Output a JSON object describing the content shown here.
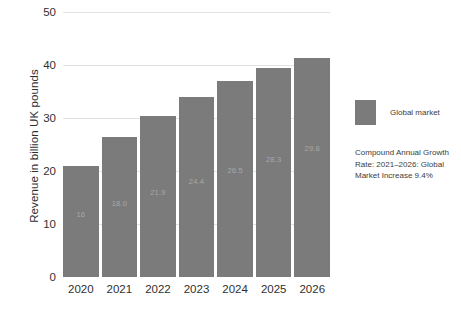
{
  "chart_data": {
    "type": "bar",
    "title": "",
    "subtitle": "",
    "xlabel": "",
    "ylabel": "Revenue in billion UK pounds",
    "categories": [
      "2020",
      "2021",
      "2022",
      "2023",
      "2024",
      "2025",
      "2026"
    ],
    "values": [
      21.0,
      26.5,
      30.4,
      33.9,
      36.9,
      39.5,
      41.3
    ],
    "bar_labels": [
      "16",
      "18.0",
      "21.9",
      "24.4",
      "26.5",
      "28.3",
      "29.8"
    ],
    "series": [
      {
        "name": "Global market",
        "values": [
          21.0,
          26.5,
          30.4,
          33.9,
          36.9,
          39.5,
          41.3
        ]
      }
    ],
    "ylim": [
      0,
      50
    ],
    "yticks": [
      0,
      10,
      20,
      30,
      40,
      50
    ],
    "ytick_labels": [
      "0",
      "10",
      "20",
      "30",
      "40",
      "50"
    ],
    "grid": true,
    "legend_position": "right",
    "legend": [
      "Global market"
    ],
    "annotations": [
      "Compound Annual Growth Rate: 2021–2026: Global Market Increase 9.4%"
    ],
    "colors": {
      "bar": "#7b7b7b",
      "gridline": "#e2e2e2",
      "text": "#2f2f2f",
      "bar_label": "#a8a8a8",
      "background": "#ffffff"
    }
  },
  "legend": {
    "swatch_name": "global-market-swatch",
    "label": "Global market"
  },
  "annotation": {
    "text": "Compound Annual Growth Rate: 2021–2026: Global Market Increase 9.4%"
  },
  "axis": {
    "y_title": "Revenue in billion UK pounds"
  }
}
